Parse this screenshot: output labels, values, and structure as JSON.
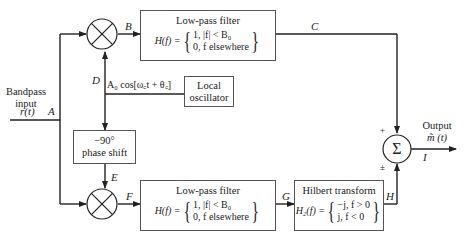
{
  "input": {
    "label_line1": "Bandpass",
    "label_line2": "input",
    "signal": "r(t)",
    "node": "A"
  },
  "nodes": {
    "B": "B",
    "C": "C",
    "D": "D",
    "E": "E",
    "F": "F",
    "G": "G",
    "H": "H",
    "I": "I"
  },
  "lpf_top": {
    "title": "Low-pass filter",
    "fn": "H(f) =",
    "case1": "1, |f| < B₀",
    "case2": "0,  f elsewhere"
  },
  "lpf_bottom": {
    "title": "Low-pass filter",
    "fn": "H(f) =",
    "case1": "1, |f| < B₀",
    "case2": "0,  f elsewhere"
  },
  "oscillator": {
    "line1": "Local",
    "line2": "oscillator",
    "signal": "A₀ cos[ω꜀t + θ꜀]"
  },
  "phase_shift": {
    "line1": "−90°",
    "line2": "phase shift"
  },
  "hilbert": {
    "title": "Hilbert transform",
    "fn": "H₂(f) =",
    "case1": "−j, f > 0",
    "case2": "j, f < 0"
  },
  "summer": {
    "symbol": "Σ",
    "sign_top": "+",
    "sign_bottom": "±"
  },
  "mixer": {
    "symbol": "⊗"
  },
  "output": {
    "label": "Output",
    "signal": "m̃ (t)"
  }
}
